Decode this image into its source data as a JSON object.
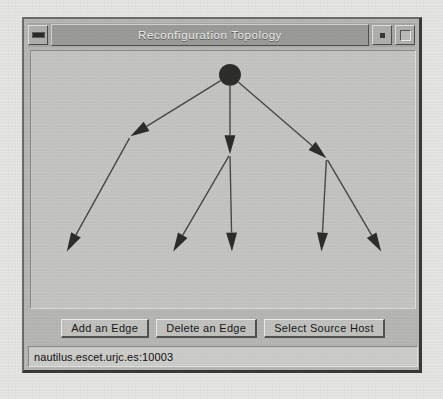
{
  "window": {
    "title": "Reconfiguration Topology",
    "controls": {
      "minimize_label": "minimize-icon",
      "restore_label": "restore-icon",
      "maximize_label": "maximize-icon"
    }
  },
  "toolbar": {
    "buttons": [
      {
        "label": "Add an Edge"
      },
      {
        "label": "Delete an Edge"
      },
      {
        "label": "Select Source Host"
      }
    ]
  },
  "status": {
    "text": "nautilus.escet.urjc.es:10003"
  },
  "chart_data": {
    "type": "diagram",
    "title": "Reconfiguration Topology",
    "layout": "directed-tree",
    "node_style": {
      "root": "filled-circle",
      "child": "arrowhead"
    },
    "colors": {
      "node": "#2e2e2c",
      "edge": "#4a4a48",
      "canvas": "#c7c7c4"
    },
    "nodes": [
      {
        "id": "root",
        "x": 200,
        "y": 24,
        "shape": "circle",
        "radius": 11,
        "level": 0
      },
      {
        "id": "mid-left",
        "x": 100,
        "y": 86,
        "shape": "arrowhead",
        "level": 1
      },
      {
        "id": "mid-center",
        "x": 200,
        "y": 104,
        "shape": "arrowhead",
        "level": 1
      },
      {
        "id": "mid-right",
        "x": 297,
        "y": 108,
        "shape": "arrowhead",
        "level": 1
      },
      {
        "id": "leaf-1",
        "x": 36,
        "y": 202,
        "shape": "arrowhead",
        "level": 2
      },
      {
        "id": "leaf-2",
        "x": 143,
        "y": 202,
        "shape": "arrowhead",
        "level": 2
      },
      {
        "id": "leaf-3",
        "x": 202,
        "y": 202,
        "shape": "arrowhead",
        "level": 2
      },
      {
        "id": "leaf-4",
        "x": 292,
        "y": 202,
        "shape": "arrowhead",
        "level": 2
      },
      {
        "id": "leaf-5",
        "x": 352,
        "y": 202,
        "shape": "arrowhead",
        "level": 2
      }
    ],
    "edges": [
      {
        "from": "root",
        "to": "mid-left"
      },
      {
        "from": "root",
        "to": "mid-center"
      },
      {
        "from": "root",
        "to": "mid-right"
      },
      {
        "from": "mid-left",
        "to": "leaf-1"
      },
      {
        "from": "mid-center",
        "to": "leaf-2"
      },
      {
        "from": "mid-center",
        "to": "leaf-3"
      },
      {
        "from": "mid-right",
        "to": "leaf-4"
      },
      {
        "from": "mid-right",
        "to": "leaf-5"
      }
    ]
  }
}
